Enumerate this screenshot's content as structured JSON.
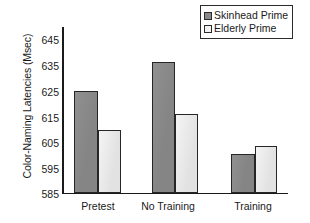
{
  "chart_data": {
    "type": "bar",
    "title": "",
    "xlabel": "",
    "ylabel": "Color-Naming Latencies (Msec)",
    "categories": [
      "Pretest",
      "No Training",
      "Training"
    ],
    "series": [
      {
        "name": "Skinhead Prime",
        "values": [
          624,
          635,
          600
        ],
        "color": "#8a8a8a"
      },
      {
        "name": "Elderly Prime",
        "values": [
          609,
          615,
          603
        ],
        "color": "#e9e9e9"
      }
    ],
    "ylim": [
      585,
      648
    ],
    "yticks": [
      585,
      595,
      605,
      615,
      625,
      635,
      645
    ],
    "ytick_labels": [
      "585",
      "595",
      "605",
      "615",
      "625",
      "635",
      "645"
    ],
    "grid": false,
    "legend_position": "top-right"
  },
  "legend": {
    "entries": [
      {
        "label": "Skinhead Prime",
        "swatch": "dark-swatch-icon"
      },
      {
        "label": "Elderly Prime",
        "swatch": "light-swatch-icon"
      }
    ]
  },
  "axes": {
    "y_title": "Color-Naming Latencies (Msec)",
    "y_tick_0": "585",
    "y_tick_1": "595",
    "y_tick_2": "605",
    "y_tick_3": "615",
    "y_tick_4": "625",
    "y_tick_5": "635",
    "y_tick_6": "645",
    "x_label_0": "Pretest",
    "x_label_1": "No Training",
    "x_label_2": "Training"
  }
}
